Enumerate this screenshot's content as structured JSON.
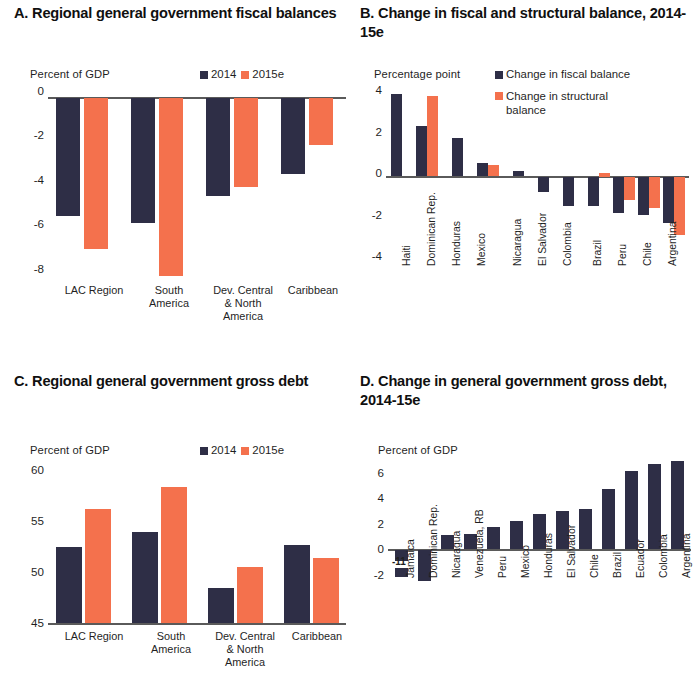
{
  "chart_data": [
    {
      "panel": "A",
      "type": "bar",
      "title": "A. Regional general government fiscal balances",
      "ylabel": "Percent of GDP",
      "xlabel": "",
      "ylim": [
        -8.6,
        0
      ],
      "yticks": [
        0,
        -2,
        -4,
        -6,
        -8
      ],
      "ytick_labels": [
        "0",
        "-2",
        "-4",
        "-6",
        "-8"
      ],
      "grid": false,
      "legend_position": "top-right",
      "categories": [
        "LAC Region",
        "South America",
        "Dev. Central & North America",
        "Caribbean"
      ],
      "series": [
        {
          "name": "2014",
          "color": "#2e2e46",
          "values": [
            -5.3,
            -5.6,
            -4.4,
            -3.4
          ]
        },
        {
          "name": "2015e",
          "color": "#f4714d",
          "values": [
            -6.8,
            -8.0,
            -4.0,
            -2.1
          ]
        }
      ]
    },
    {
      "panel": "B",
      "type": "bar",
      "title": "B. Change in fiscal and structural balance, 2014-15e",
      "ylabel": "Percentage point",
      "xlabel": "",
      "ylim": [
        -4,
        4
      ],
      "yticks": [
        4,
        2,
        0,
        -2,
        -4
      ],
      "ytick_labels": [
        "4",
        "2",
        "0",
        "-2",
        "-4"
      ],
      "grid": false,
      "legend_position": "top-right",
      "categories": [
        "Haiti",
        "Dominican Rep.",
        "Honduras",
        "Mexico",
        "Nicaragua",
        "El Salvador",
        "Colombia",
        "Brazil",
        "Peru",
        "Chile",
        "Argentina"
      ],
      "series": [
        {
          "name": "Change in fiscal balance",
          "color": "#2e2e46",
          "values": [
            3.9,
            2.4,
            1.8,
            0.6,
            0.2,
            -0.7,
            -1.4,
            -1.4,
            -1.7,
            -1.8,
            -2.2
          ]
        },
        {
          "name": "Change in structural balance",
          "color": "#f4714d",
          "values": [
            null,
            3.8,
            null,
            0.5,
            null,
            null,
            null,
            0.1,
            -1.1,
            -1.5,
            -2.8
          ]
        }
      ]
    },
    {
      "panel": "C",
      "type": "bar",
      "title": "C. Regional general government gross debt",
      "ylabel": "Percent of GDP",
      "xlabel": "",
      "ylim": [
        45,
        60
      ],
      "yticks": [
        60,
        55,
        50,
        45
      ],
      "ytick_labels": [
        "60",
        "55",
        "50",
        "45"
      ],
      "grid": false,
      "legend_position": "top-right",
      "categories": [
        "LAC Region",
        "South America",
        "Dev. Central & North America",
        "Caribbean"
      ],
      "series": [
        {
          "name": "2014",
          "color": "#2e2e46",
          "values": [
            52.4,
            53.9,
            48.4,
            52.6
          ]
        },
        {
          "name": "2015e",
          "color": "#f4714d",
          "values": [
            56.2,
            58.3,
            50.5,
            51.4
          ]
        }
      ]
    },
    {
      "panel": "D",
      "type": "bar",
      "title": "D. Change in general government gross debt, 2014-15e",
      "ylabel": "Percent of GDP",
      "xlabel": "",
      "ylim": [
        -2,
        7.4
      ],
      "yticks": [
        6,
        4,
        2,
        0,
        -2
      ],
      "ytick_labels": [
        "6",
        "4",
        "2",
        "0",
        "-2"
      ],
      "grid": false,
      "legend_position": "none",
      "categories": [
        "Jamaica",
        "Dominican Rep.",
        "Nicaragua",
        "Venezuela, RB",
        "Peru",
        "Mexico",
        "Honduras",
        "El Salvador",
        "Chile",
        "Brazil",
        "Ecuador",
        "Colombia",
        "Argentina"
      ],
      "series": [
        {
          "name": "Change in gross debt",
          "color": "#2e2e46",
          "values": [
            -11,
            -2.4,
            1.1,
            1.2,
            1.7,
            2.2,
            2.7,
            3.0,
            3.1,
            4.7,
            6.1,
            6.7,
            6.9
          ]
        }
      ],
      "annotations": [
        {
          "text": "-11",
          "for_category": "Jamaica"
        }
      ]
    }
  ],
  "panel_a": {
    "title": "A. Regional general government fiscal balances",
    "axis_unit": "Percent of GDP",
    "yticks": [
      "0",
      "-2",
      "-4",
      "-6",
      "-8"
    ],
    "legend": [
      "2014",
      "2015e"
    ],
    "xlabels": [
      "LAC Region",
      "South\nAmerica",
      "Dev. Central\n& North\nAmerica",
      "Caribbean"
    ]
  },
  "panel_b": {
    "title": "B. Change in fiscal and structural balance, 2014-15e",
    "axis_unit": "Percentage point",
    "yticks": [
      "4",
      "2",
      "0",
      "-2",
      "-4"
    ],
    "legend": [
      "Change in fiscal balance",
      "Change in structural balance"
    ],
    "xlabels": [
      "Haiti",
      "Dominican Rep.",
      "Honduras",
      "Mexico",
      "Nicaragua",
      "El Salvador",
      "Colombia",
      "Brazil",
      "Peru",
      "Chile",
      "Argentina"
    ]
  },
  "panel_c": {
    "title": "C. Regional general government gross debt",
    "axis_unit": "Percent of GDP",
    "yticks": [
      "60",
      "55",
      "50",
      "45"
    ],
    "legend": [
      "2014",
      "2015e"
    ],
    "xlabels": [
      "LAC Region",
      "South\nAmerica",
      "Dev. Central\n& North\nAmerica",
      "Caribbean"
    ]
  },
  "panel_d": {
    "title": "D. Change in general government gross debt, 2014-15e",
    "axis_unit": "Percent of GDP",
    "yticks": [
      "6",
      "4",
      "2",
      "0",
      "-2"
    ],
    "legend": [],
    "xlabels": [
      "Jamaica",
      "Dominican Rep.",
      "Nicaragua",
      "Venezuela, RB",
      "Peru",
      "Mexico",
      "Honduras",
      "El Salvador",
      "Chile",
      "Brazil",
      "Ecuador",
      "Colombia",
      "Argentina"
    ],
    "annotation_jamaica": "-11"
  },
  "colors": {
    "navy": "#2e2e46",
    "orange": "#f4714d",
    "axis": "#5a5a5a",
    "text": "#1f1f1f"
  }
}
